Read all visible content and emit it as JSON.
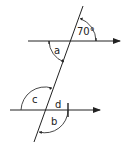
{
  "diagram": {
    "type": "parallel-lines-transversal",
    "known_angle": "70°",
    "angle_labels": {
      "a": "a",
      "b": "b",
      "c": "c",
      "d": "d"
    },
    "colors": {
      "stroke": "#222222",
      "background": "#ffffff"
    }
  }
}
